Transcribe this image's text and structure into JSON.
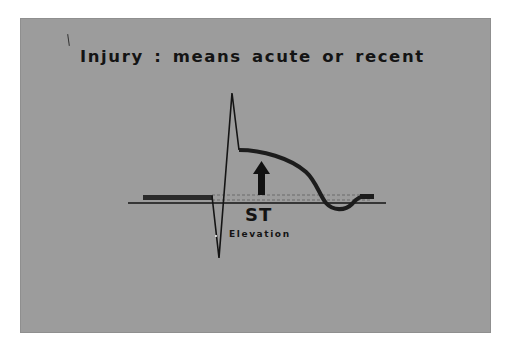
{
  "slide": {
    "title": "Injury :  means acute or recent",
    "st_label": "ST",
    "elevation_label": "Elevation",
    "background_color": "#9c9c9c",
    "ink_color": "#141414"
  },
  "diagram": {
    "elements": [
      "isoelectric-baseline",
      "pr-segment-bar",
      "qrs-complex",
      "elevated-st-segment",
      "t-wave-inverted-dip",
      "upward-elevation-arrow",
      "dashed-reference-lines"
    ]
  }
}
